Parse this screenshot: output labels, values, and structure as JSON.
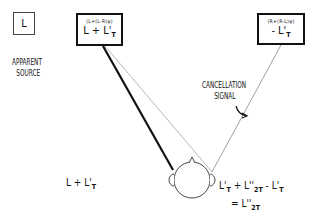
{
  "apparent_source": {
    "box_label": "L",
    "caption_line1": "APPARENT",
    "caption_line2": "SOURCE"
  },
  "left_speaker": {
    "formula_small": "(L+(L-R)ψ)",
    "formula_main": "L + L'",
    "formula_sub": "T"
  },
  "right_speaker": {
    "formula_small": "(R+(R-L)ψ)",
    "formula_main": "- L'",
    "formula_sub": "T"
  },
  "cancellation_label": {
    "line1": "CANCELLATION",
    "line2": "SIGNAL"
  },
  "left_ear_signal": {
    "main": "L + L'",
    "sub": "T"
  },
  "right_ear_equation": {
    "line1_t1": "L'",
    "line1_t1_sub": "T",
    "line1_op1": " + ",
    "line1_t2": "L''",
    "line1_t2_sub": "2T",
    "line1_op2": " - ",
    "line1_t3": "L'",
    "line1_t3_sub": "T",
    "line2_op": "= ",
    "line2_t": "L''",
    "line2_t_sub": "2T"
  },
  "colors": {
    "ink": "#111111",
    "thin_line": "#888888",
    "background": "#ffffff"
  }
}
